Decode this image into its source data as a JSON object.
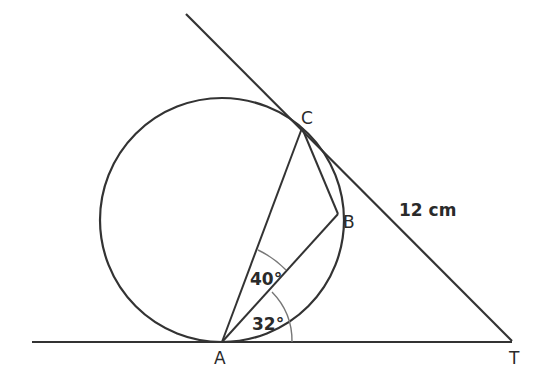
{
  "figure": {
    "type": "circle-geometry",
    "circle": {
      "cx": 222,
      "cy": 220,
      "r": 122
    },
    "points": {
      "A": {
        "label": "A",
        "x": 222,
        "y": 342
      },
      "B": {
        "label": "B",
        "x": 338,
        "y": 214
      },
      "C": {
        "label": "C",
        "x": 302,
        "y": 128
      },
      "T": {
        "label": "T",
        "x": 512,
        "y": 341
      }
    },
    "angles": {
      "CAB": "40°",
      "BAT": "32°"
    },
    "lengths": {
      "CT": "12 cm"
    },
    "colors": {
      "line": "#333333",
      "arc": "#777777"
    }
  }
}
